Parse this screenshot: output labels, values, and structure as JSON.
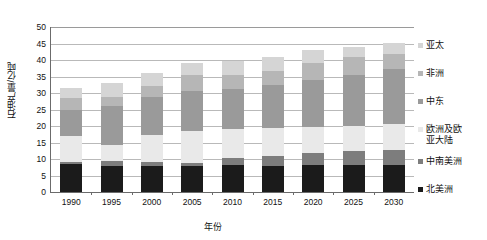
{
  "chart_data": {
    "type": "bar",
    "stacked": true,
    "title": "",
    "xlabel": "年份",
    "ylabel": "石油产量/亿吨",
    "categories": [
      "1990",
      "1995",
      "2000",
      "2005",
      "2010",
      "2015",
      "2020",
      "2025",
      "2030"
    ],
    "ylim": [
      0,
      50
    ],
    "yticks": [
      0,
      5,
      10,
      15,
      20,
      25,
      30,
      35,
      40,
      45,
      50
    ],
    "grid": true,
    "legend_position": "right",
    "series": [
      {
        "name": "北美洲",
        "color": "#1b1b1b",
        "values": [
          8.6,
          7.9,
          8.0,
          7.9,
          8.1,
          8.0,
          8.1,
          8.1,
          8.1
        ]
      },
      {
        "name": "中南美洲",
        "color": "#7d7d7d",
        "values": [
          0.4,
          1.6,
          1.1,
          0.9,
          2.3,
          3.0,
          3.7,
          4.3,
          4.7
        ]
      },
      {
        "name": "欧洲及欧亚大陆",
        "color": "#e9e9e9",
        "values": [
          8.0,
          4.6,
          8.3,
          9.7,
          8.6,
          8.5,
          7.8,
          7.5,
          7.8
        ]
      },
      {
        "name": "中东",
        "color": "#9a9a9a",
        "values": [
          8.0,
          11.9,
          11.3,
          12.2,
          12.1,
          12.8,
          14.4,
          15.7,
          16.8
        ]
      },
      {
        "name": "非洲",
        "color": "#b6b6b6",
        "values": [
          3.4,
          2.9,
          3.3,
          4.7,
          4.5,
          4.5,
          5.0,
          5.2,
          4.5
        ]
      },
      {
        "name": "亚太",
        "color": "#d5d5d5",
        "values": [
          3.2,
          4.0,
          4.1,
          3.8,
          4.0,
          4.2,
          3.9,
          3.3,
          3.2
        ]
      }
    ],
    "totals": [
      31.6,
      32.9,
      36.1,
      39.2,
      39.6,
      41.0,
      42.9,
      44.1,
      45.1
    ]
  },
  "legend": {
    "entries": [
      {
        "label": "亚太",
        "color": "#d5d5d5"
      },
      {
        "label": "非洲",
        "color": "#b6b6b6"
      },
      {
        "label": "中东",
        "color": "#9a9a9a"
      },
      {
        "label": "欧洲及欧\n亚大陆",
        "color": "#e9e9e9"
      },
      {
        "label": "中南美洲",
        "color": "#7d7d7d"
      },
      {
        "label": "北美洲",
        "color": "#1b1b1b"
      }
    ]
  },
  "axes": {
    "y_title": "石油产量/亿吨",
    "x_title": "年份"
  }
}
